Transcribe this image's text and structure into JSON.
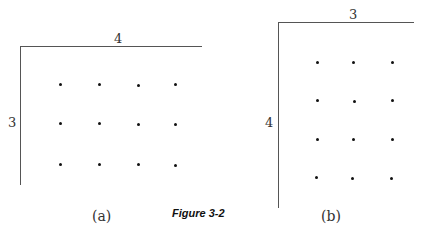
{
  "caption": "Figure 3-2",
  "figures": [
    {
      "id": "a",
      "label": "(a)",
      "top_dimension": "4",
      "side_dimension": "3",
      "grid": {
        "rows": 3,
        "cols": 4
      }
    },
    {
      "id": "b",
      "label": "(b)",
      "top_dimension": "3",
      "side_dimension": "4",
      "grid": {
        "rows": 4,
        "cols": 3
      }
    }
  ]
}
